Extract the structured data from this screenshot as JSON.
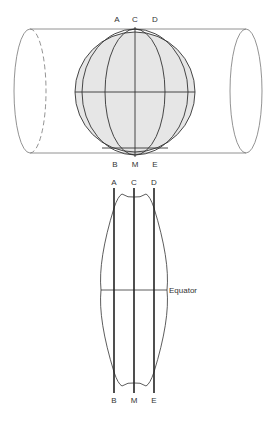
{
  "diagram": {
    "top_figure": {
      "labels_top": [
        "A",
        "C",
        "D"
      ],
      "labels_bottom": [
        "B",
        "M",
        "E"
      ],
      "globe_fill": "#e6e6e6",
      "line_color": "#333333",
      "cylinder_color": "#777777"
    },
    "bottom_figure": {
      "labels_top": [
        "A",
        "C",
        "D"
      ],
      "labels_bottom": [
        "B",
        "M",
        "E"
      ],
      "equator_label": "Equator"
    }
  }
}
